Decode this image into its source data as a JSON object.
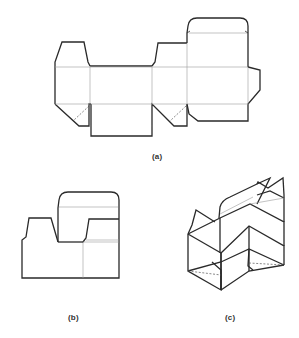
{
  "figure": {
    "panels": [
      {
        "id": "a",
        "label": "(a)",
        "content": "Flat unfolded carton blank (dieline) with glue flap, dust flaps, tuck flap and bottom closure panels"
      },
      {
        "id": "b",
        "label": "(b)",
        "content": "Partially folded blank, side view with top tuck flap raised"
      },
      {
        "id": "c",
        "label": "(c)",
        "content": "Isometric view of carton erected with bottom folded and top flaps open"
      }
    ],
    "line_styles": {
      "cut_line_color": "#2a2a2a",
      "fold_line_color": "#9a9a9a",
      "hidden_line_style": "dashed"
    }
  }
}
